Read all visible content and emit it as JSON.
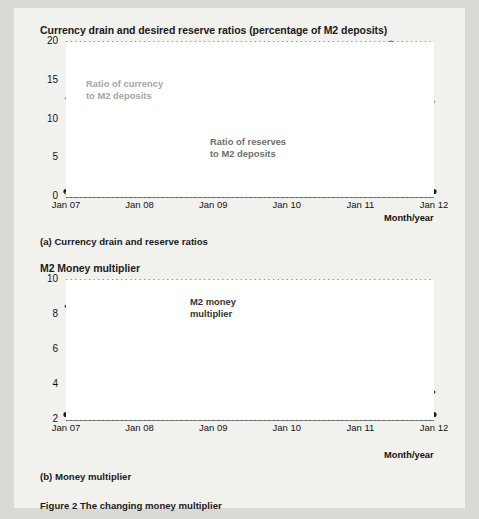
{
  "figure": {
    "caption": "Figure 2  The changing money multiplier"
  },
  "panel_a": {
    "title": "Currency drain and desired reserve ratios (percentage of M2 deposits)",
    "caption": "(a) Currency drain and reserve ratios",
    "axis_note": "Month/year",
    "label_currency_line1": "Ratio of currency",
    "label_currency_line2": "to M2 deposits",
    "label_reserves_line1": "Ratio of reserves",
    "label_reserves_line2": "to M2 deposits"
  },
  "panel_b": {
    "title": "M2 Money multiplier",
    "caption": "(b) Money multiplier",
    "axis_note": "Month/year",
    "label_mult_line1": "M2 money",
    "label_mult_line2": "multiplier"
  },
  "colors": {
    "currency_line": "#a3a3a3",
    "reserves_line": "#7d7d7d",
    "multiplier_line": "#3a3a3a",
    "grid": "#2b2b2b",
    "axis": "#1b1b1b",
    "panel_bg": "#f1f1ee",
    "plot_bg": "#ffffff"
  },
  "chart_data": [
    {
      "type": "line",
      "id": "currency-drain-and-reserve-ratios",
      "title": "Currency drain and desired reserve ratios (percentage of M2 deposits)",
      "xlabel": "Month/year",
      "ylabel": "",
      "xticks": [
        "Jan 07",
        "Jan 08",
        "Jan 09",
        "Jan 10",
        "Jan 11",
        "Jan 12"
      ],
      "xtick_values": [
        2007.0,
        2008.0,
        2009.0,
        2010.0,
        2011.0,
        2012.0
      ],
      "yticks": [
        0,
        5,
        10,
        15,
        20
      ],
      "xlim": [
        2007.0,
        2012.0
      ],
      "ylim": [
        0,
        20
      ],
      "grid": "horizontal-dotted",
      "legend": "inline-annotations",
      "series": [
        {
          "name": "Ratio of currency to M2 deposits",
          "color": "#a3a3a3",
          "x": [
            2007.0,
            2007.17,
            2007.33,
            2007.5,
            2007.67,
            2007.83,
            2008.0,
            2008.17,
            2008.33,
            2008.5,
            2008.67,
            2008.83,
            2009.0,
            2009.17,
            2009.33,
            2009.5,
            2009.67,
            2009.83,
            2010.0,
            2010.17,
            2010.33,
            2010.5,
            2010.67,
            2010.83,
            2011.0,
            2011.17,
            2011.33,
            2011.5,
            2011.67,
            2011.83,
            2012.0
          ],
          "values": [
            12.75,
            12.7,
            12.7,
            12.65,
            12.6,
            12.6,
            12.55,
            12.5,
            12.45,
            12.45,
            12.4,
            12.45,
            12.5,
            12.4,
            12.3,
            12.35,
            12.5,
            12.45,
            12.4,
            12.3,
            12.2,
            12.1,
            12.05,
            12.0,
            12.0,
            12.05,
            12.15,
            12.25,
            12.3,
            12.3,
            12.3
          ]
        },
        {
          "name": "Ratio of reserves to M2 deposits",
          "color": "#7d7d7d",
          "x": [
            2007.0,
            2007.17,
            2007.33,
            2007.5,
            2007.67,
            2007.83,
            2008.0,
            2008.17,
            2008.33,
            2008.5,
            2008.67,
            2008.75,
            2008.83,
            2008.92,
            2009.0,
            2009.08,
            2009.17,
            2009.25,
            2009.33,
            2009.42,
            2009.5,
            2009.58,
            2009.67,
            2009.75,
            2009.83,
            2009.92,
            2010.0,
            2010.08,
            2010.17,
            2010.25,
            2010.33,
            2010.5,
            2010.67,
            2010.83,
            2010.92,
            2011.0,
            2011.08,
            2011.17,
            2011.25,
            2011.33,
            2011.42,
            2011.5
          ],
          "values": [
            0.5,
            0.5,
            0.5,
            0.5,
            0.5,
            0.5,
            0.5,
            0.5,
            0.5,
            0.5,
            0.6,
            2.5,
            6.5,
            9.5,
            11.2,
            10.2,
            11.8,
            10.3,
            11.2,
            11.6,
            10.2,
            10.0,
            10.4,
            11.5,
            12.8,
            13.2,
            14.2,
            15.4,
            15.3,
            14.3,
            14.0,
            13.2,
            12.8,
            12.2,
            12.0,
            12.5,
            14.5,
            17.0,
            18.6,
            19.0,
            20.0,
            19.4
          ]
        }
      ]
    },
    {
      "type": "line",
      "id": "m2-money-multiplier",
      "title": "M2 Money multiplier",
      "xlabel": "Month/year",
      "ylabel": "",
      "xticks": [
        "Jan 07",
        "Jan 08",
        "Jan 09",
        "Jan 10",
        "Jan 11",
        "Jan 12"
      ],
      "xtick_values": [
        2007.0,
        2008.0,
        2009.0,
        2010.0,
        2011.0,
        2012.0
      ],
      "yticks": [
        2,
        4,
        6,
        8,
        10
      ],
      "xlim": [
        2007.0,
        2012.0
      ],
      "ylim": [
        2,
        10
      ],
      "grid": "horizontal-dotted",
      "legend": "inline-annotations",
      "series": [
        {
          "name": "M2 money multiplier",
          "color": "#3a3a3a",
          "x": [
            2007.0,
            2007.17,
            2007.33,
            2007.5,
            2007.67,
            2007.83,
            2008.0,
            2008.17,
            2008.33,
            2008.5,
            2008.58,
            2008.67,
            2008.75,
            2008.83,
            2008.92,
            2009.0,
            2009.08,
            2009.17,
            2009.25,
            2009.33,
            2009.42,
            2009.5,
            2009.58,
            2009.67,
            2009.75,
            2009.83,
            2009.92,
            2010.0,
            2010.17,
            2010.33,
            2010.5,
            2010.67,
            2010.83,
            2011.0,
            2011.17,
            2011.33,
            2011.42,
            2011.5,
            2011.67,
            2011.83,
            2012.0
          ],
          "values": [
            8.5,
            8.55,
            8.6,
            8.65,
            8.7,
            8.75,
            8.8,
            8.85,
            8.95,
            9.05,
            9.1,
            9.05,
            9.0,
            8.1,
            6.6,
            5.3,
            4.7,
            4.5,
            4.85,
            4.55,
            4.65,
            4.65,
            4.5,
            4.55,
            4.6,
            4.45,
            4.3,
            4.2,
            4.1,
            4.05,
            4.1,
            4.15,
            4.2,
            4.2,
            4.1,
            3.8,
            3.65,
            3.6,
            3.6,
            3.65,
            3.6
          ]
        }
      ]
    }
  ]
}
